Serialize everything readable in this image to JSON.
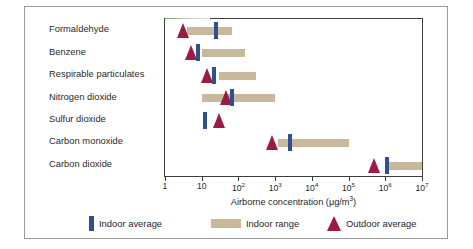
{
  "chart_data": {
    "type": "bar",
    "title": "",
    "subtitle": "",
    "xlabel_text": "Airborne concentration (μg/m",
    "xlabel_sup": "3",
    "xlabel_tail": ")",
    "ylabel": "",
    "xscale": "log",
    "xlim": [
      1,
      10000000
    ],
    "grid": false,
    "legend_position": "bottom",
    "tick_values": [
      1,
      10,
      100,
      1000,
      10000,
      100000,
      1000000,
      10000000
    ],
    "tick_labels": [
      {
        "base": "1",
        "exp": ""
      },
      {
        "base": "10",
        "exp": ""
      },
      {
        "base": "10",
        "exp": "2"
      },
      {
        "base": "10",
        "exp": "3"
      },
      {
        "base": "10",
        "exp": "4"
      },
      {
        "base": "10",
        "exp": "5"
      },
      {
        "base": "10",
        "exp": "6"
      },
      {
        "base": "10",
        "exp": "7"
      }
    ],
    "categories": [
      "Formaldehyde",
      "Benzene",
      "Respirable particulates",
      "Nitrogen dioxide",
      "Sulfur dioxide",
      "Carbon monoxide",
      "Carbon dioxide"
    ],
    "series": [
      {
        "name": "Indoor range",
        "type": "range",
        "color": "#c8b89c",
        "values": [
          [
            4,
            65
          ],
          [
            10,
            150
          ],
          [
            30,
            300
          ],
          [
            10,
            1000
          ],
          null,
          [
            1200,
            100000
          ],
          [
            1000000,
            10000000
          ]
        ]
      },
      {
        "name": "Indoor average",
        "type": "marker",
        "color": "#2d4f93",
        "values": [
          25,
          8,
          22,
          65,
          12,
          2500,
          1100000
        ]
      },
      {
        "name": "Outdoor average",
        "type": "marker",
        "color": "#9b1b41",
        "values": [
          3,
          5,
          14,
          45,
          30,
          800,
          500000
        ]
      }
    ]
  },
  "legend": {
    "items": [
      {
        "label": "Indoor average",
        "swatch": "blue-bar-swatch"
      },
      {
        "label": "Indoor range",
        "swatch": "tan-band-swatch"
      },
      {
        "label": "Outdoor average",
        "swatch": "maroon-triangle-swatch"
      }
    ]
  },
  "colors": {
    "indoor_average": "#2d4f93",
    "indoor_range": "#c8b89c",
    "outdoor_average": "#9b1b41",
    "axis": "#3d3d3d",
    "frame": "#9a9a9a",
    "text": "#1f1f1f"
  }
}
